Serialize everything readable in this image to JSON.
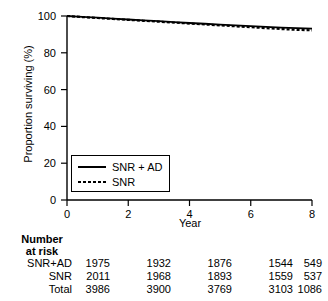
{
  "chart_data": {
    "type": "line",
    "title": "",
    "xlabel": "Year",
    "ylabel": "Proportion surviving (%)",
    "xlim": [
      0,
      8
    ],
    "ylim": [
      0,
      100
    ],
    "xticks": [
      0,
      2,
      4,
      6,
      8
    ],
    "yticks": [
      0,
      20,
      40,
      60,
      80,
      100
    ],
    "grid": false,
    "legend_position": "lower-left-inside",
    "series": [
      {
        "name": "SNR + AD",
        "style": "solid",
        "color": "#000000",
        "x": [
          0,
          0.5,
          1,
          1.5,
          2,
          2.5,
          3,
          3.5,
          4,
          4.5,
          5,
          5.5,
          6,
          6.5,
          7,
          7.5,
          8
        ],
        "values": [
          100,
          99.5,
          99.1,
          98.6,
          98.1,
          97.6,
          97.2,
          96.7,
          96.2,
          95.8,
          95.3,
          94.9,
          94.5,
          94.1,
          93.7,
          93.4,
          93.1
        ]
      },
      {
        "name": "SNR",
        "style": "dotted",
        "color": "#000000",
        "x": [
          0,
          0.5,
          1,
          1.5,
          2,
          2.5,
          3,
          3.5,
          4,
          4.5,
          5,
          5.5,
          6,
          6.5,
          7,
          7.5,
          8
        ],
        "values": [
          100,
          99.4,
          98.9,
          98.4,
          97.9,
          97.4,
          96.9,
          96.4,
          95.9,
          95.4,
          94.9,
          94.4,
          93.9,
          93.4,
          92.9,
          92.5,
          92.2
        ]
      }
    ]
  },
  "legend": {
    "entries": [
      {
        "label": "SNR + AD",
        "style": "solid"
      },
      {
        "label": "SNR",
        "style": "dotted"
      }
    ]
  },
  "axes": {
    "xlabel": "Year",
    "ylabel": "Proportion surviving (%)",
    "xtick_labels": [
      "0",
      "2",
      "4",
      "6",
      "8"
    ],
    "ytick_labels": [
      "0",
      "20",
      "40",
      "60",
      "80",
      "100"
    ]
  },
  "risk_table": {
    "heading_line1": "Number",
    "heading_line2": "at risk",
    "columns": [
      "0",
      "2",
      "4",
      "6",
      "8"
    ],
    "rows": [
      {
        "label": "SNR+AD",
        "values": [
          "1975",
          "1932",
          "1876",
          "1544",
          "549"
        ]
      },
      {
        "label": "SNR",
        "values": [
          "2011",
          "1968",
          "1893",
          "1559",
          "537"
        ]
      },
      {
        "label": "Total",
        "values": [
          "3986",
          "3900",
          "3769",
          "3103",
          "1086"
        ]
      }
    ]
  }
}
